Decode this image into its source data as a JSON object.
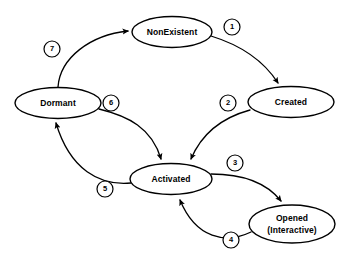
{
  "diagram": {
    "type": "state-transition-diagram",
    "background_color": "#ffffff",
    "line_color": "#000000",
    "nodes": [
      {
        "id": "nonexistent",
        "label": "NonExistent",
        "label2": "",
        "cx": 172,
        "cy": 32,
        "rx": 40,
        "ry": 15.5
      },
      {
        "id": "created",
        "label": "Created",
        "label2": "",
        "cx": 291,
        "cy": 102,
        "rx": 43,
        "ry": 15.5
      },
      {
        "id": "dormant",
        "label": "Dormant",
        "label2": "",
        "cx": 58,
        "cy": 103,
        "rx": 43,
        "ry": 15.5
      },
      {
        "id": "activated",
        "label": "Activated",
        "label2": "",
        "cx": 171,
        "cy": 179,
        "rx": 41,
        "ry": 15.5
      },
      {
        "id": "opened",
        "label": "Opened",
        "label2": "(Interactive)",
        "cx": 292,
        "cy": 224,
        "rx": 43,
        "ry": 19
      }
    ],
    "edges": [
      {
        "id": "e1",
        "label": "1",
        "from": "nonexistent",
        "to": "created",
        "path": "M 211 36 C 237 44 262 58 278 83",
        "badge_cx": 232,
        "badge_cy": 27
      },
      {
        "id": "e2",
        "label": "2",
        "from": "created",
        "to": "activated",
        "path": "M 250 110 C 228 116 204 128 191 159",
        "badge_cx": 228,
        "badge_cy": 103
      },
      {
        "id": "e3",
        "label": "3",
        "from": "activated",
        "to": "opened",
        "path": "M 211 174 C 240 174 266 182 281 201",
        "badge_cx": 235,
        "badge_cy": 163
      },
      {
        "id": "e4",
        "label": "4",
        "from": "opened",
        "to": "activated",
        "path": "M 251 232 C 226 244 196 239 180 200",
        "badge_cx": 231,
        "badge_cy": 240
      },
      {
        "id": "e5",
        "label": "5",
        "from": "activated",
        "to": "dormant",
        "path": "M 131 183 C 100 186 70 170 56 123",
        "badge_cx": 105,
        "badge_cy": 189
      },
      {
        "id": "e6",
        "label": "6",
        "from": "dormant",
        "to": "activated",
        "path": "M 99 109 C 128 116 152 128 161 159",
        "badge_cx": 111,
        "badge_cy": 103
      },
      {
        "id": "e7",
        "label": "7",
        "from": "dormant",
        "to": "nonexistent",
        "path": "M 58 87 C 60 58 90 35 128 31",
        "badge_cx": 52,
        "badge_cy": 49
      }
    ],
    "badge_radius": 8
  }
}
